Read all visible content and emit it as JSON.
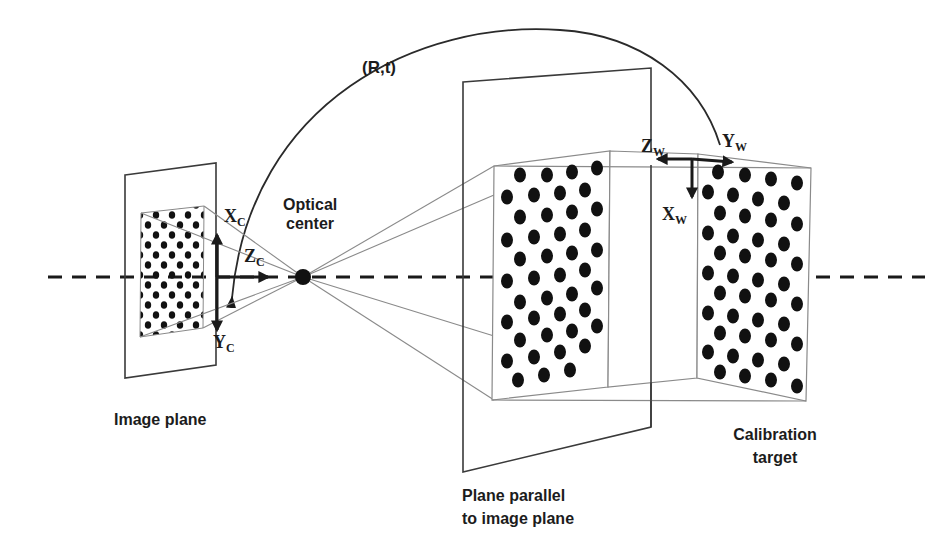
{
  "figure": {
    "type": "camera-calibration-diagram",
    "labels": {
      "transform": "(R,t)",
      "optical_center_line1": "Optical",
      "optical_center_line2": "center",
      "image_plane": "Image plane",
      "parallel_plane_line1": "Plane parallel",
      "parallel_plane_line2": "to image plane",
      "calibration_target_line1": "Calibration",
      "calibration_target_line2": "target"
    },
    "camera_axes": {
      "x": {
        "base": "X",
        "sub": "C"
      },
      "y": {
        "base": "Y",
        "sub": "C"
      },
      "z": {
        "base": "Z",
        "sub": "C"
      }
    },
    "world_axes": {
      "x": {
        "base": "X",
        "sub": "W"
      },
      "y": {
        "base": "Y",
        "sub": "W"
      },
      "z": {
        "base": "Z",
        "sub": "W"
      }
    },
    "colors": {
      "ink": "#1c1c1c",
      "thin_line": "#8a8a8a",
      "background": "#ffffff"
    }
  }
}
